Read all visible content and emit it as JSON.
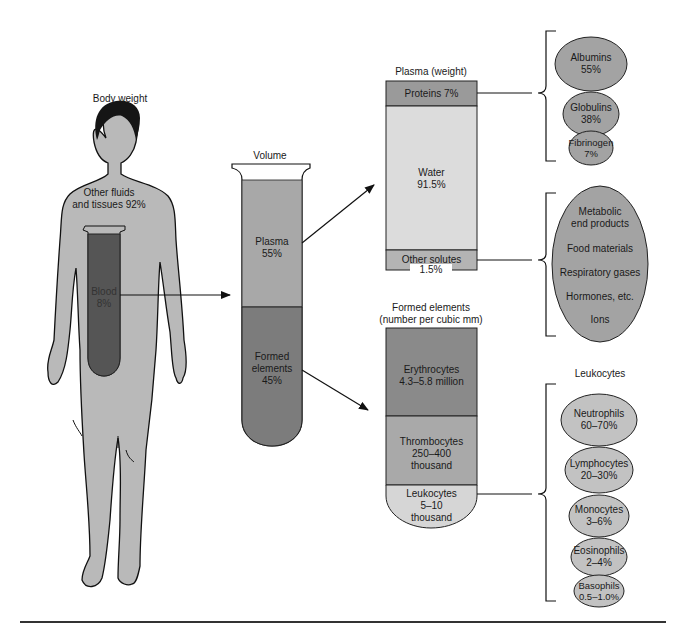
{
  "body": {
    "title": "Body weight",
    "other_fluids": "Other fluids",
    "other_fluids_2": "and tissues 92%",
    "blood": "Blood",
    "blood_pct": "8%"
  },
  "tube": {
    "title": "Volume",
    "plasma": "Plasma",
    "plasma_pct": "55%",
    "formed_1": "Formed",
    "formed_2": "elements",
    "formed_pct": "45%"
  },
  "plasma_weight": {
    "title": "Plasma (weight)",
    "proteins": "Proteins 7%",
    "water": "Water",
    "water_pct": "91.5%",
    "other_solutes": "Other solutes",
    "other_solutes_pct": "1.5%"
  },
  "proteins": [
    {
      "name": "Albumins",
      "pct": "55%"
    },
    {
      "name": "Globulins",
      "pct": "38%"
    },
    {
      "name": "Fibrinogen",
      "pct": "7%"
    }
  ],
  "solutes": [
    "Metabolic",
    "end products",
    "Food materials",
    "Respiratory gases",
    "Hormones, etc.",
    "Ions"
  ],
  "formed": {
    "title_1": "Formed elements",
    "title_2": "(number per cubic mm)",
    "erythro": "Erythrocytes",
    "erythro_val": "4.3–5.8 million",
    "thrombo": "Thrombocytes",
    "thrombo_val_1": "250–400",
    "thrombo_val_2": "thousand",
    "leuko": "Leukocytes",
    "leuko_val_1": "5–10",
    "leuko_val_2": "thousand"
  },
  "leukocytes": {
    "title": "Leukocytes",
    "items": [
      {
        "name": "Neutrophils",
        "pct": "60–70%"
      },
      {
        "name": "Lymphocytes",
        "pct": "20–30%"
      },
      {
        "name": "Monocytes",
        "pct": "3–6%"
      },
      {
        "name": "Eosinophils",
        "pct": "2–4%"
      },
      {
        "name": "Basophils",
        "pct": "0.5–1.0%"
      }
    ]
  },
  "colors": {
    "body_fill": "#b9b9b9",
    "blood_dark": "#5a5a5a",
    "plasma": "#a8a8a8",
    "formed": "#7c7c7c",
    "proteins_band": "#9a9a9a",
    "water": "#dcdcdc",
    "erythro": "#8a8a8a",
    "thrombo": "#a9a9a9",
    "leuko": "#d6d6d6",
    "oval": "#a3a3a3",
    "oval_light": "#c2c2c2"
  }
}
